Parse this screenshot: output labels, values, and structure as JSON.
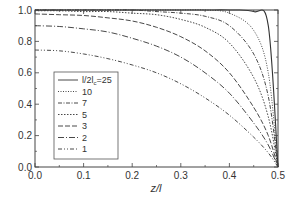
{
  "chart_data": {
    "type": "line",
    "title": "",
    "xlabel": "z/l",
    "ylabel": "",
    "xlim": [
      0.0,
      0.5
    ],
    "ylim": [
      0.0,
      1.0
    ],
    "xticks": [
      "0.0",
      "0.1",
      "0.2",
      "0.3",
      "0.4",
      "0.5"
    ],
    "yticks": [
      "0.0",
      "0.2",
      "0.4",
      "0.6",
      "0.8",
      "1.0"
    ],
    "grid": false,
    "legend_position": "lower left",
    "legend_title_prefix": "l/2l",
    "legend_subscript": "c",
    "x": [
      0.0,
      0.05,
      0.1,
      0.15,
      0.2,
      0.25,
      0.3,
      0.35,
      0.4,
      0.45,
      0.48,
      0.5
    ],
    "series": [
      {
        "name": "25",
        "legend_label": "l/2lc=25",
        "dash": "",
        "values": [
          1.0,
          1.0,
          1.0,
          1.0,
          1.0,
          1.0,
          1.0,
          1.0,
          1.0,
          0.99,
          0.9,
          0.0
        ]
      },
      {
        "name": "10",
        "legend_label": "10",
        "dash": "1,1.5",
        "values": [
          1.0,
          1.0,
          1.0,
          1.0,
          1.0,
          1.0,
          1.0,
          1.0,
          0.98,
          0.87,
          0.6,
          0.0
        ]
      },
      {
        "name": "7",
        "legend_label": "7",
        "dash": "4,1.5,1,1.5",
        "values": [
          1.0,
          1.0,
          1.0,
          1.0,
          1.0,
          0.99,
          0.98,
          0.96,
          0.9,
          0.72,
          0.45,
          0.0
        ]
      },
      {
        "name": "5",
        "legend_label": "5",
        "dash": "1.5,1.5",
        "values": [
          0.995,
          0.995,
          0.99,
          0.99,
          0.98,
          0.97,
          0.94,
          0.89,
          0.79,
          0.57,
          0.32,
          0.0
        ]
      },
      {
        "name": "3",
        "legend_label": "3",
        "dash": "5,2",
        "values": [
          0.975,
          0.97,
          0.965,
          0.95,
          0.93,
          0.89,
          0.83,
          0.74,
          0.6,
          0.38,
          0.2,
          0.0
        ]
      },
      {
        "name": "2",
        "legend_label": "2",
        "dash": "6,2,1,2",
        "values": [
          0.9,
          0.895,
          0.88,
          0.86,
          0.82,
          0.77,
          0.7,
          0.6,
          0.47,
          0.28,
          0.14,
          0.0
        ]
      },
      {
        "name": "1",
        "legend_label": "1",
        "dash": "4,2,1,2,1,2",
        "values": [
          0.745,
          0.74,
          0.72,
          0.69,
          0.65,
          0.6,
          0.53,
          0.44,
          0.33,
          0.19,
          0.09,
          0.0
        ]
      }
    ]
  }
}
